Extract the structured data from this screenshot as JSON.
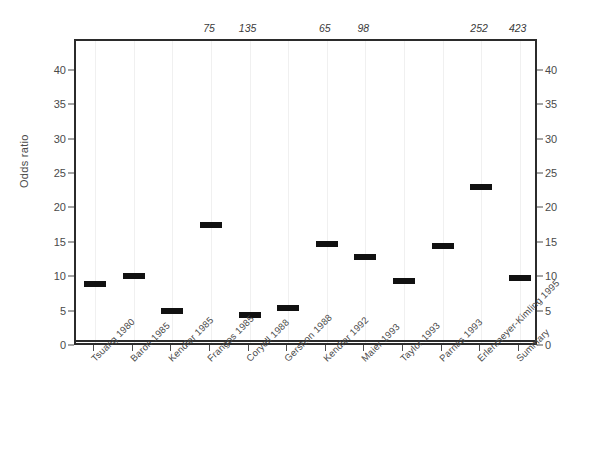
{
  "chart_data": {
    "type": "scatter",
    "title": "",
    "xlabel": "",
    "ylabel": "Odds ratio",
    "ylim": [
      0,
      44.5
    ],
    "yticks": [
      0,
      5,
      10,
      15,
      20,
      25,
      30,
      35,
      40
    ],
    "ytick_labels": [
      "0",
      "5",
      "10",
      "15",
      "20",
      "25",
      "30",
      "35",
      "40"
    ],
    "grid": false,
    "legend": "none",
    "reference_line": 1,
    "categories": [
      "Tsuang 1980",
      "Baron 1985",
      "Kendler 1985",
      "Frangos 1985",
      "Coryell 1988",
      "Gershon 1988",
      "Kendler 1992",
      "Maier 1993",
      "Taylor 1993",
      "Parnas 1993",
      "Erlenmeyer-Kimling 1995",
      "Summary"
    ],
    "values": [
      9.2,
      10.3,
      5.2,
      17.8,
      4.6,
      5.6,
      15.0,
      13.1,
      9.6,
      14.7,
      23.3,
      10.0
    ],
    "top_annotations": [
      "",
      "",
      "",
      "75",
      "135",
      "",
      "65",
      "98",
      "",
      "",
      "252",
      "423"
    ],
    "series": [
      {
        "name": "Odds ratio",
        "values": [
          9.2,
          10.3,
          5.2,
          17.8,
          4.6,
          5.6,
          15.0,
          13.1,
          9.6,
          14.7,
          23.3,
          10.0
        ]
      }
    ]
  },
  "axes": {
    "left_label": "Odds ratio",
    "tick_labels": [
      "40",
      "35",
      "30",
      "25",
      "20",
      "15",
      "10",
      "5",
      "0"
    ],
    "tick_values": [
      40,
      35,
      30,
      25,
      20,
      15,
      10,
      5,
      0
    ]
  },
  "colors": {
    "marker": "#111111",
    "frame": "#2b2b2b",
    "text": "#4a4a4a",
    "background": "#ffffff"
  }
}
